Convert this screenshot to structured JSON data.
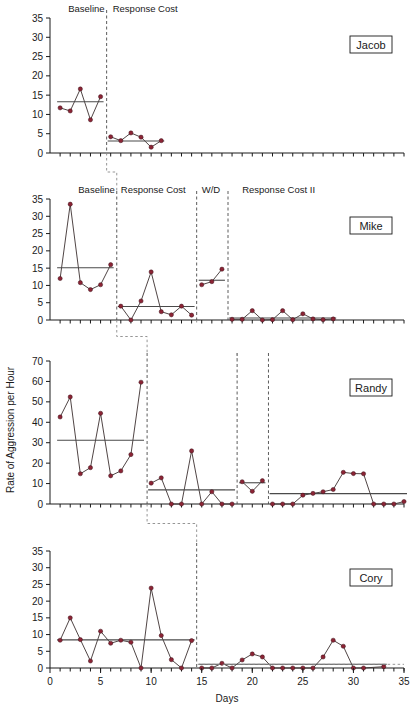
{
  "figure": {
    "ylabel": "Rate of Aggression per Hour",
    "xlabel": "Days"
  },
  "chart_data": {
    "type": "line",
    "title": "",
    "xlabel": "Days",
    "ylabel": "Rate of Aggression per Hour",
    "xlim": [
      0,
      35
    ],
    "xticks": [
      0,
      5,
      10,
      15,
      20,
      25,
      30,
      35
    ],
    "grid": false,
    "legend": "none",
    "panels": [
      {
        "subject": "Jacob",
        "ylim": [
          0,
          35
        ],
        "yticks": [
          0,
          5,
          10,
          15,
          20,
          25,
          30,
          35
        ],
        "phases": [
          {
            "label": "Baseline",
            "start_day": 1,
            "end_day": 6,
            "mean": 13.3,
            "points": [
              {
                "x": 1,
                "y": 11.7
              },
              {
                "x": 2,
                "y": 10.9
              },
              {
                "x": 3,
                "y": 16.6
              },
              {
                "x": 4,
                "y": 8.6
              },
              {
                "x": 5,
                "y": 14.6
              }
            ]
          },
          {
            "label": "Response Cost",
            "start_day": 6,
            "end_day": 12,
            "mean": 3.1,
            "points": [
              {
                "x": 6,
                "y": 4.2
              },
              {
                "x": 7,
                "y": 3.2
              },
              {
                "x": 8,
                "y": 5.2
              },
              {
                "x": 9,
                "y": 4.1
              },
              {
                "x": 10,
                "y": 1.5
              },
              {
                "x": 11,
                "y": 3.2
              }
            ]
          }
        ],
        "dividers": [
          5.6
        ]
      },
      {
        "subject": "Mike",
        "ylim": [
          0,
          35
        ],
        "yticks": [
          0,
          5,
          10,
          15,
          20,
          25,
          30,
          35
        ],
        "phases": [
          {
            "label": "Baseline",
            "start_day": 1,
            "end_day": 7,
            "mean": 15.1,
            "points": [
              {
                "x": 1,
                "y": 12.0
              },
              {
                "x": 2,
                "y": 33.5
              },
              {
                "x": 3,
                "y": 10.8
              },
              {
                "x": 4,
                "y": 8.8
              },
              {
                "x": 5,
                "y": 10.2
              },
              {
                "x": 6,
                "y": 16.0
              }
            ]
          },
          {
            "label": "Response Cost",
            "start_day": 7,
            "end_day": 14,
            "mean": 3.9,
            "points": [
              {
                "x": 7,
                "y": 4.0
              },
              {
                "x": 8,
                "y": 0.0
              },
              {
                "x": 9,
                "y": 5.5
              },
              {
                "x": 10,
                "y": 13.9
              },
              {
                "x": 11,
                "y": 2.4
              },
              {
                "x": 12,
                "y": 1.5
              },
              {
                "x": 13,
                "y": 4.0
              },
              {
                "x": 14,
                "y": 1.4
              }
            ]
          },
          {
            "label": "W/D",
            "start_day": 15,
            "end_day": 18,
            "mean": 11.5,
            "points": [
              {
                "x": 15,
                "y": 10.2
              },
              {
                "x": 16,
                "y": 11.1
              },
              {
                "x": 17,
                "y": 14.7
              }
            ]
          },
          {
            "label": "Response Cost II",
            "start_day": 18,
            "end_day": 31,
            "mean": 0.6,
            "points": [
              {
                "x": 18,
                "y": 0.2
              },
              {
                "x": 19,
                "y": 0.2
              },
              {
                "x": 20,
                "y": 2.7
              },
              {
                "x": 21,
                "y": 0.0
              },
              {
                "x": 22,
                "y": 0.1
              },
              {
                "x": 23,
                "y": 2.7
              },
              {
                "x": 24,
                "y": 0.1
              },
              {
                "x": 25,
                "y": 1.8
              },
              {
                "x": 26,
                "y": 0.3
              },
              {
                "x": 27,
                "y": 0.1
              },
              {
                "x": 28,
                "y": 0.3
              }
            ]
          }
        ],
        "dividers": [
          6.6,
          14.5,
          17.6
        ]
      },
      {
        "subject": "Randy",
        "ylim": [
          0,
          70
        ],
        "yticks": [
          0,
          10,
          20,
          30,
          40,
          50,
          60,
          70
        ],
        "phases": [
          {
            "label": "",
            "start_day": 1,
            "end_day": 10,
            "mean": 31.2,
            "points": [
              {
                "x": 1,
                "y": 42.6
              },
              {
                "x": 2,
                "y": 52.4
              },
              {
                "x": 3,
                "y": 14.8
              },
              {
                "x": 4,
                "y": 17.8
              },
              {
                "x": 5,
                "y": 44.4
              },
              {
                "x": 6,
                "y": 13.8
              },
              {
                "x": 7,
                "y": 16.2
              },
              {
                "x": 8,
                "y": 24.2
              },
              {
                "x": 9,
                "y": 59.6
              }
            ]
          },
          {
            "label": "",
            "start_day": 10,
            "end_day": 19,
            "mean": 6.9,
            "points": [
              {
                "x": 10,
                "y": 10.2
              },
              {
                "x": 11,
                "y": 12.8
              },
              {
                "x": 12,
                "y": 0.0
              },
              {
                "x": 13,
                "y": 0.0
              },
              {
                "x": 14,
                "y": 26.0
              },
              {
                "x": 15,
                "y": 0.0
              },
              {
                "x": 16,
                "y": 6.0
              },
              {
                "x": 17,
                "y": 0.0
              },
              {
                "x": 18,
                "y": 0.0
              }
            ]
          },
          {
            "label": "",
            "start_day": 19,
            "end_day": 22,
            "mean": 10.4,
            "points": [
              {
                "x": 19,
                "y": 10.9
              },
              {
                "x": 20,
                "y": 6.2
              },
              {
                "x": 21,
                "y": 11.4
              }
            ]
          },
          {
            "label": "",
            "start_day": 22,
            "end_day": 34,
            "mean": 5.1,
            "points": [
              {
                "x": 22,
                "y": 0.0
              },
              {
                "x": 23,
                "y": 0.0
              },
              {
                "x": 24,
                "y": 0.0
              },
              {
                "x": 25,
                "y": 4.3
              },
              {
                "x": 26,
                "y": 5.2
              },
              {
                "x": 27,
                "y": 6.0
              },
              {
                "x": 28,
                "y": 7.1
              },
              {
                "x": 29,
                "y": 15.5
              },
              {
                "x": 30,
                "y": 14.9
              },
              {
                "x": 31,
                "y": 14.8
              },
              {
                "x": 32,
                "y": 0.0
              },
              {
                "x": 33,
                "y": 0.0
              },
              {
                "x": 34,
                "y": 0.0
              },
              {
                "x": 35,
                "y": 1.2
              }
            ]
          }
        ],
        "dividers": [
          9.6,
          18.5,
          21.6
        ]
      },
      {
        "subject": "Cory",
        "ylim": [
          0,
          35
        ],
        "yticks": [
          0,
          5,
          10,
          15,
          20,
          25,
          30,
          35
        ],
        "phases": [
          {
            "label": "",
            "start_day": 1,
            "end_day": 14,
            "mean": 8.4,
            "points": [
              {
                "x": 1,
                "y": 8.3
              },
              {
                "x": 2,
                "y": 15.0
              },
              {
                "x": 3,
                "y": 8.5
              },
              {
                "x": 4,
                "y": 2.1
              },
              {
                "x": 5,
                "y": 11.0
              },
              {
                "x": 6,
                "y": 7.4
              },
              {
                "x": 7,
                "y": 8.3
              },
              {
                "x": 8,
                "y": 7.7
              },
              {
                "x": 9,
                "y": 0.0
              },
              {
                "x": 10,
                "y": 23.9
              },
              {
                "x": 11,
                "y": 9.7
              },
              {
                "x": 12,
                "y": 2.5
              },
              {
                "x": 13,
                "y": 0.0
              },
              {
                "x": 14,
                "y": 8.2
              }
            ]
          },
          {
            "label": "",
            "start_day": 15,
            "end_day": 33,
            "mean": 1.1,
            "points": [
              {
                "x": 15,
                "y": 0.0
              },
              {
                "x": 16,
                "y": 0.0
              },
              {
                "x": 17,
                "y": 1.4
              },
              {
                "x": 18,
                "y": 0.0
              },
              {
                "x": 19,
                "y": 2.4
              },
              {
                "x": 20,
                "y": 4.2
              },
              {
                "x": 21,
                "y": 3.3
              },
              {
                "x": 22,
                "y": 0.0
              },
              {
                "x": 23,
                "y": 0.0
              },
              {
                "x": 24,
                "y": 0.0
              },
              {
                "x": 25,
                "y": 0.0
              },
              {
                "x": 26,
                "y": 0.0
              },
              {
                "x": 27,
                "y": 3.3
              },
              {
                "x": 28,
                "y": 8.3
              },
              {
                "x": 29,
                "y": 6.5
              },
              {
                "x": 30,
                "y": 0.0
              },
              {
                "x": 31,
                "y": 0.0
              },
              {
                "x": 33,
                "y": 0.4
              }
            ]
          }
        ],
        "dividers": [
          14.5
        ]
      }
    ]
  },
  "phase_headers_top": [
    {
      "label": "Baseline",
      "x": 5.4
    },
    {
      "label": "Response Cost",
      "x": 6.2
    }
  ],
  "phase_headers_mike": [
    {
      "label": "Baseline",
      "x": 6.4
    },
    {
      "label": "Response Cost",
      "x": 7.0
    },
    {
      "label": "W/D",
      "x": 15.0
    },
    {
      "label": "Response Cost II",
      "x": 19.0
    }
  ],
  "colors": {
    "point": "#8c2435",
    "line": "#3c3030",
    "mean": "#4a4a4a",
    "divider": "#4a4a4a",
    "connector": "#8a8a8a",
    "axis": "#1a1a1a"
  }
}
